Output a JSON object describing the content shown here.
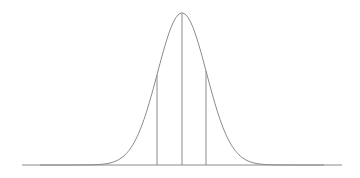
{
  "diagram": {
    "type": "normal-distribution-curve",
    "colors": {
      "background": "#ffffff",
      "curve": "#8a8a8a",
      "baseline": "#8a8a8a",
      "markers": "#8a8a8a"
    },
    "geometry": {
      "baseline_y": 165,
      "baseline_x_start": 22,
      "baseline_x_end": 342,
      "mean_x": 182,
      "peak_y": 13,
      "sigma_px": 24.5,
      "curve_x_start": 40,
      "curve_x_end": 324
    },
    "markers": [
      {
        "name": "minus-one-sigma-line",
        "x": 157
      },
      {
        "name": "mean-line",
        "x": 182
      },
      {
        "name": "plus-one-sigma-line",
        "x": 206
      }
    ]
  }
}
